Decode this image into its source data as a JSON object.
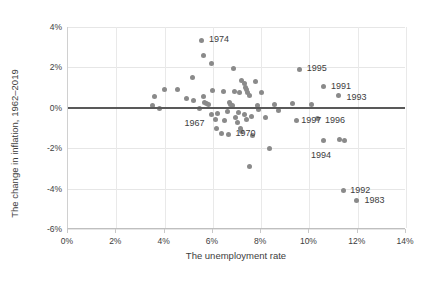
{
  "chart_data": {
    "type": "scatter",
    "title": "",
    "xlabel": "The unemployment rate",
    "ylabel": "The change in inflation, 1962–2019",
    "xlim": [
      0,
      14
    ],
    "ylim": [
      -6,
      4
    ],
    "xticks": [
      "0%",
      "2%",
      "4%",
      "6%",
      "8%",
      "10%",
      "12%",
      "14%"
    ],
    "xtick_values": [
      0,
      2,
      4,
      6,
      8,
      10,
      12,
      14
    ],
    "yticks": [
      "4%",
      "2%",
      "0%",
      "-2%",
      "-4%",
      "-6%"
    ],
    "ytick_values": [
      4,
      2,
      0,
      -2,
      -4,
      -6
    ],
    "grid": true,
    "legend": false,
    "zero_reference_line": 0,
    "marker_color": "#8a8a8a",
    "points": [
      {
        "x": 3.5,
        "y": 0.1
      },
      {
        "x": 3.6,
        "y": 0.55
      },
      {
        "x": 3.8,
        "y": -0.05
      },
      {
        "x": 4.0,
        "y": 0.9
      },
      {
        "x": 4.55,
        "y": 0.9
      },
      {
        "x": 4.9,
        "y": 0.45
      },
      {
        "x": 5.15,
        "y": 1.5
      },
      {
        "x": 5.2,
        "y": 0.35
      },
      {
        "x": 5.45,
        "y": -0.05,
        "label": "1967",
        "label_dx": -14,
        "label_dy": 14
      },
      {
        "x": 5.55,
        "y": 3.35,
        "label": "1974",
        "label_dx": 8,
        "label_dy": -1
      },
      {
        "x": 5.6,
        "y": 2.6
      },
      {
        "x": 5.6,
        "y": 0.55
      },
      {
        "x": 5.65,
        "y": 0.25
      },
      {
        "x": 5.75,
        "y": 0.2
      },
      {
        "x": 5.8,
        "y": 0.15
      },
      {
        "x": 5.95,
        "y": 2.2
      },
      {
        "x": 5.95,
        "y": -0.35
      },
      {
        "x": 6.0,
        "y": 0.85
      },
      {
        "x": 6.1,
        "y": -0.6
      },
      {
        "x": 6.15,
        "y": -1.0
      },
      {
        "x": 6.2,
        "y": -0.3
      },
      {
        "x": 6.35,
        "y": -1.25
      },
      {
        "x": 6.45,
        "y": 0.8
      },
      {
        "x": 6.5,
        "y": -0.65
      },
      {
        "x": 6.6,
        "y": -0.2
      },
      {
        "x": 6.65,
        "y": -1.3,
        "label": "1970",
        "label_dx": 8,
        "label_dy": -1
      },
      {
        "x": 6.7,
        "y": 0.25
      },
      {
        "x": 6.75,
        "y": 0.15
      },
      {
        "x": 6.8,
        "y": 0.1
      },
      {
        "x": 6.85,
        "y": 1.95
      },
      {
        "x": 6.9,
        "y": 0.8
      },
      {
        "x": 6.95,
        "y": -0.5
      },
      {
        "x": 7.0,
        "y": -0.75
      },
      {
        "x": 7.05,
        "y": -0.25
      },
      {
        "x": 7.1,
        "y": 0.75
      },
      {
        "x": 7.15,
        "y": -1.0
      },
      {
        "x": 7.2,
        "y": -1.15
      },
      {
        "x": 7.2,
        "y": 1.35
      },
      {
        "x": 7.3,
        "y": 1.2
      },
      {
        "x": 7.3,
        "y": -0.35
      },
      {
        "x": 7.35,
        "y": 1.0
      },
      {
        "x": 7.4,
        "y": 0.9
      },
      {
        "x": 7.4,
        "y": -0.6
      },
      {
        "x": 7.45,
        "y": 0.75
      },
      {
        "x": 7.5,
        "y": -2.9
      },
      {
        "x": 7.5,
        "y": 0.6
      },
      {
        "x": 7.6,
        "y": -0.45
      },
      {
        "x": 7.65,
        "y": -1.35
      },
      {
        "x": 7.75,
        "y": 1.3
      },
      {
        "x": 7.85,
        "y": 0.1
      },
      {
        "x": 7.9,
        "y": -0.1
      },
      {
        "x": 8.0,
        "y": 0.75
      },
      {
        "x": 8.2,
        "y": -0.5
      },
      {
        "x": 8.35,
        "y": -2.0
      },
      {
        "x": 8.55,
        "y": 0.15
      },
      {
        "x": 8.7,
        "y": -0.15
      },
      {
        "x": 9.3,
        "y": 0.2
      },
      {
        "x": 9.45,
        "y": -0.65,
        "label": "1997",
        "label_dx": 6,
        "label_dy": -1
      },
      {
        "x": 9.6,
        "y": 1.9,
        "label": "1995",
        "label_dx": 8,
        "label_dy": -1
      },
      {
        "x": 10.1,
        "y": 0.15
      },
      {
        "x": 10.35,
        "y": -0.55,
        "label": "1996",
        "label_dx": 8,
        "label_dy": 1
      },
      {
        "x": 10.6,
        "y": 1.05,
        "label": "1991",
        "label_dx": 8,
        "label_dy": -1
      },
      {
        "x": 10.6,
        "y": -1.6,
        "label": "1994",
        "label_dx": -12,
        "label_dy": 15
      },
      {
        "x": 11.2,
        "y": 0.6,
        "label": "1993",
        "label_dx": 9,
        "label_dy": 1
      },
      {
        "x": 11.25,
        "y": -1.55
      },
      {
        "x": 11.45,
        "y": -1.6
      },
      {
        "x": 11.4,
        "y": -4.1,
        "label": "1992",
        "label_dx": 8,
        "label_dy": -1
      },
      {
        "x": 11.95,
        "y": -4.6,
        "label": "1983",
        "label_dx": 9,
        "label_dy": -1
      }
    ]
  }
}
